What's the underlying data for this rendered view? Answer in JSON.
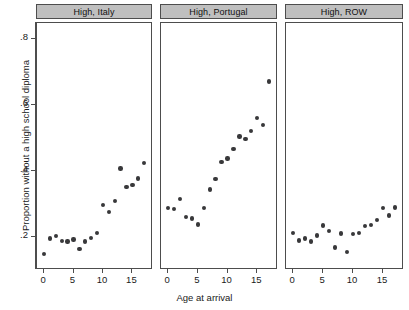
{
  "chart_data": {
    "type": "scatter",
    "title": "",
    "xlabel": "Age at arrival",
    "ylabel": "Proportion without a high school diploma",
    "xlim": [
      -1.2,
      18.5
    ],
    "ylim": [
      0.1,
      0.85
    ],
    "xticks": [
      0,
      5,
      10,
      15
    ],
    "xtick_labels": [
      "0",
      "5",
      "10",
      "15"
    ],
    "yticks": [
      0.2,
      0.4,
      0.6,
      0.8
    ],
    "ytick_labels": [
      ".2",
      ".4",
      ".6",
      ".8"
    ],
    "grid": false,
    "legend": false,
    "marker_color": "#38383a",
    "strip_color": "#bfbfbf",
    "panels": [
      {
        "label": "High, Italy",
        "x": [
          0,
          1,
          2,
          3,
          4,
          5,
          6,
          7,
          8,
          9,
          10,
          11,
          12,
          13,
          14,
          15,
          16,
          17
        ],
        "y": [
          0.148,
          0.196,
          0.203,
          0.189,
          0.186,
          0.193,
          0.163,
          0.186,
          0.198,
          0.213,
          0.298,
          0.277,
          0.309,
          0.408,
          0.352,
          0.358,
          0.378,
          0.425
        ]
      },
      {
        "label": "High, Portugal",
        "x": [
          0,
          1,
          2,
          3,
          4,
          5,
          6,
          7,
          8,
          9,
          10,
          11,
          12,
          13,
          14,
          15,
          16,
          17
        ],
        "y": [
          0.288,
          0.286,
          0.316,
          0.261,
          0.256,
          0.238,
          0.288,
          0.344,
          0.376,
          0.428,
          0.438,
          0.468,
          0.505,
          0.497,
          0.523,
          0.561,
          0.541,
          0.672
        ]
      },
      {
        "label": "High, ROW",
        "x": [
          0,
          1,
          2,
          3,
          4,
          5,
          6,
          7,
          8,
          9,
          10,
          11,
          12,
          13,
          14,
          15,
          16,
          17
        ],
        "y": [
          0.213,
          0.19,
          0.196,
          0.186,
          0.205,
          0.235,
          0.218,
          0.168,
          0.211,
          0.155,
          0.209,
          0.212,
          0.233,
          0.236,
          0.251,
          0.288,
          0.265,
          0.29
        ]
      }
    ]
  }
}
